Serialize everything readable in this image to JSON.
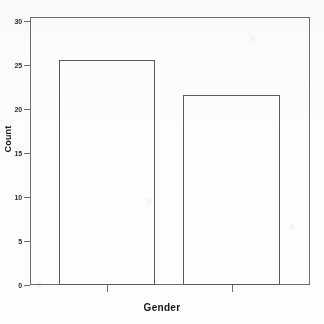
{
  "chart_data": {
    "type": "bar",
    "title": "",
    "subtitle": "",
    "xlabel": "Gender",
    "ylabel": "Count",
    "categories": [
      "Male",
      "Female"
    ],
    "category_labels_legible": false,
    "values": [
      26,
      22
    ],
    "ylim": [
      0,
      31
    ],
    "yticks": [
      0,
      5,
      10,
      15,
      20,
      25,
      30
    ],
    "ytick_labels": [
      "0",
      "5",
      "10",
      "15",
      "20",
      "25",
      "30"
    ],
    "xticks": [
      1,
      2
    ],
    "grid": false,
    "legend": "none",
    "bar_fill": "#ffffff",
    "bar_edge_color": "#5a5a5a",
    "axis_color": "#6e6e6e",
    "background": "#fdfdfd",
    "text_color": "#1a1a1a",
    "bars": [
      {
        "label": "Male",
        "value": 26
      },
      {
        "label": "Female",
        "value": 22
      }
    ]
  },
  "axes": {
    "y_title": "Count",
    "x_title": "Gender",
    "y_ticks": [
      {
        "label": "30",
        "value": 30
      },
      {
        "label": "25",
        "value": 25
      },
      {
        "label": "20",
        "value": 20
      },
      {
        "label": "15",
        "value": 15
      },
      {
        "label": "10",
        "value": 10
      },
      {
        "label": "5",
        "value": 5
      },
      {
        "label": "0",
        "value": 0
      }
    ],
    "x_ticks": [
      {
        "label": "",
        "position": 1
      },
      {
        "label": "",
        "position": 2
      }
    ]
  }
}
